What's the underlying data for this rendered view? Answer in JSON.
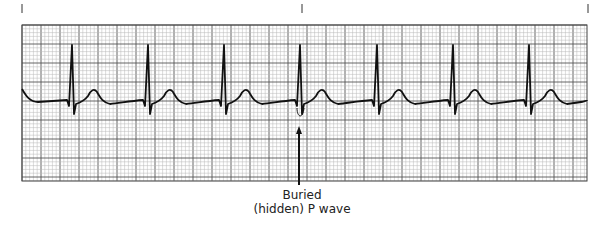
{
  "figure": {
    "type": "ECG rhythm strip",
    "annotation": {
      "line1": "Buried",
      "line2": "(hidden) P wave"
    },
    "time_markers_x": [
      22,
      302,
      588
    ],
    "grid": {
      "left": 22,
      "top": 25,
      "right": 587,
      "bottom": 181,
      "small": 3.8,
      "large": 19
    },
    "baseline_y": 102,
    "r_peaks_x": [
      72,
      148,
      224,
      300,
      377,
      453,
      529
    ],
    "colors": {
      "trace": "#111111",
      "grid_minor": "#b8b8b8",
      "grid_major": "#555555",
      "arrow": "#111111"
    }
  }
}
